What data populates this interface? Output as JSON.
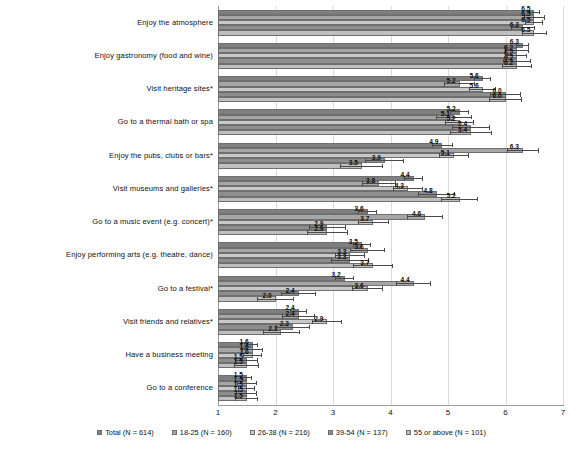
{
  "chart_data": {
    "type": "bar",
    "orientation": "horizontal",
    "title": "",
    "xlabel": "",
    "ylabel": "",
    "xlim": [
      1,
      7
    ],
    "xticks": [
      "1",
      "2",
      "3",
      "4",
      "5",
      "6",
      "7"
    ],
    "grid": true,
    "legend_position": "bottom",
    "error_bars": true,
    "categories": [
      "Enjoy the atmosphere",
      "Enjoy gastronomy (food and wine)",
      "Visit heritage sites*",
      "Go to a thermal bath or spa",
      "Enjoy the pubs, clubs or bars*",
      "Visit museums and galleries*",
      "Go to a music event (e.g. concert)*",
      "Enjoy performing arts (e.g. theatre, dance)",
      "Go to a festival*",
      "Visit friends and relatives*",
      "Have a business meeting",
      "Go to a conference"
    ],
    "series": [
      {
        "name": "Total (N = 614)",
        "color": "#7f7f7f",
        "values": [
          6.5,
          6.3,
          5.6,
          5.2,
          4.9,
          4.4,
          3.6,
          3.5,
          3.2,
          2.4,
          1.6,
          1.5
        ],
        "err": [
          0.1,
          0.11,
          0.14,
          0.16,
          0.18,
          0.16,
          0.17,
          0.16,
          0.17,
          0.15,
          0.1,
          0.09
        ]
      },
      {
        "name": "18-25 (N = 160)",
        "color": "#a6a6a6",
        "values": [
          6.5,
          6.2,
          5.2,
          5.1,
          6.3,
          3.8,
          4.6,
          3.6,
          4.4,
          2.4,
          1.6,
          1.5
        ],
        "err": [
          0.18,
          0.21,
          0.27,
          0.31,
          0.28,
          0.3,
          0.31,
          0.31,
          0.3,
          0.29,
          0.19,
          0.17
        ]
      },
      {
        "name": "26-38 (N = 216)",
        "color": "#c9c9c9",
        "values": [
          6.5,
          6.2,
          5.6,
          5.2,
          5.1,
          4.3,
          3.7,
          3.3,
          3.6,
          2.9,
          1.6,
          1.5
        ],
        "err": [
          0.16,
          0.18,
          0.23,
          0.26,
          0.26,
          0.26,
          0.27,
          0.26,
          0.27,
          0.26,
          0.16,
          0.15
        ]
      },
      {
        "name": "39-54 (N = 137)",
        "color": "#8e8e8e",
        "values": [
          6.3,
          6.2,
          6.0,
          5.4,
          3.9,
          4.8,
          2.9,
          3.3,
          2.4,
          2.3,
          1.5,
          1.5
        ],
        "err": [
          0.21,
          0.24,
          0.27,
          0.33,
          0.34,
          0.32,
          0.32,
          0.33,
          0.31,
          0.3,
          0.2,
          0.18
        ]
      },
      {
        "name": "55 or above (N = 101)",
        "color": "#bfbfbf",
        "values": [
          6.5,
          6.2,
          6.0,
          5.4,
          3.5,
          5.2,
          2.9,
          3.7,
          2.0,
          2.1,
          1.5,
          1.5
        ],
        "err": [
          0.22,
          0.26,
          0.29,
          0.37,
          0.37,
          0.33,
          0.36,
          0.35,
          0.33,
          0.32,
          0.22,
          0.2
        ]
      }
    ],
    "footnote_marker": "*"
  }
}
